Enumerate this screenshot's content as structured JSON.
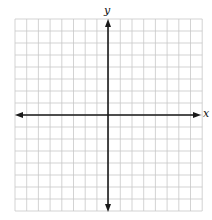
{
  "figure": {
    "type": "coordinate-plane",
    "grid": {
      "columns": 16,
      "rows": 16,
      "left": 15,
      "top": 19,
      "cell_width": 11.7,
      "cell_height": 12,
      "line_color": "#c8c8c8"
    },
    "axes": {
      "color": "#1a1a1a",
      "x_label": "x",
      "y_label": "y",
      "origin_px": [
        108,
        115
      ]
    }
  }
}
